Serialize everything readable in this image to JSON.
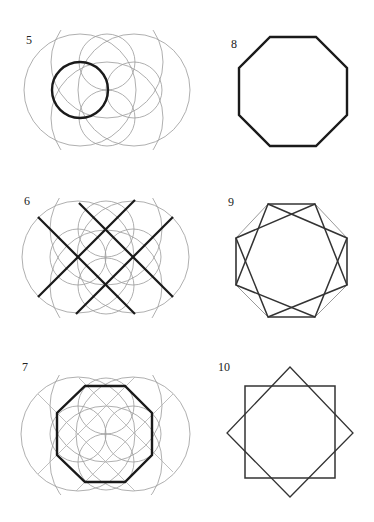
{
  "colors": {
    "background": "#ffffff",
    "construction": "#9a9a9a",
    "construction_light": "#b0b0b0",
    "thick": "#1a1a1a",
    "medium": "#333333",
    "label": "#222222"
  },
  "panels": [
    {
      "id": "5",
      "label": "5",
      "label_pos": [
        26,
        34
      ],
      "description": "Overlapping construction circles with one thick circle",
      "thin_circles": [
        {
          "cx": 80,
          "cy": 90,
          "r": 56
        },
        {
          "cx": 134,
          "cy": 90,
          "r": 56
        },
        {
          "cx": 80,
          "cy": 90,
          "r": 28
        },
        {
          "cx": 134,
          "cy": 90,
          "r": 28
        },
        {
          "cx": 107,
          "cy": 62,
          "r": 28
        },
        {
          "cx": 107,
          "cy": 118,
          "r": 28
        },
        {
          "cx": 107,
          "cy": 62,
          "r": 56,
          "clip": true
        },
        {
          "cx": 107,
          "cy": 118,
          "r": 56,
          "clip": true
        }
      ],
      "thick_circles": [
        {
          "cx": 80,
          "cy": 90,
          "r": 28
        }
      ]
    },
    {
      "id": "8",
      "label": "8",
      "label_pos": [
        231,
        38
      ],
      "description": "Regular octagon",
      "thick_polygons": [
        [
          [
            270,
            37
          ],
          [
            316,
            37
          ],
          [
            347,
            68
          ],
          [
            347,
            115
          ],
          [
            316,
            146
          ],
          [
            270,
            146
          ],
          [
            239,
            115
          ],
          [
            239,
            68
          ]
        ]
      ]
    },
    {
      "id": "6",
      "label": "6",
      "label_pos": [
        24,
        195
      ],
      "description": "Construction circles with four thick diagonal lines",
      "thin_circles": [
        {
          "cx": 78,
          "cy": 257,
          "r": 56
        },
        {
          "cx": 133,
          "cy": 257,
          "r": 56
        },
        {
          "cx": 78,
          "cy": 257,
          "r": 28
        },
        {
          "cx": 133,
          "cy": 257,
          "r": 28
        },
        {
          "cx": 106,
          "cy": 229,
          "r": 28
        },
        {
          "cx": 106,
          "cy": 286,
          "r": 28
        },
        {
          "cx": 106,
          "cy": 229,
          "r": 56,
          "clip": true
        },
        {
          "cx": 106,
          "cy": 286,
          "r": 56,
          "clip": true
        }
      ],
      "thick_lines": [
        [
          38,
          217,
          135,
          314
        ],
        [
          79,
          203,
          173,
          297
        ],
        [
          38,
          297,
          135,
          200
        ],
        [
          76,
          314,
          173,
          217
        ]
      ]
    },
    {
      "id": "9",
      "label": "9",
      "label_pos": [
        228,
        196
      ],
      "description": "Octagon with two inscribed overlapping squares",
      "octagon": [
        [
          268,
          204
        ],
        [
          315,
          204
        ],
        [
          347,
          238
        ],
        [
          347,
          285
        ],
        [
          315,
          317
        ],
        [
          268,
          317
        ],
        [
          236,
          285
        ],
        [
          236,
          238
        ]
      ],
      "squares": [
        [
          [
            268,
            204
          ],
          [
            347,
            238
          ],
          [
            315,
            317
          ],
          [
            236,
            285
          ]
        ],
        [
          [
            315,
            204
          ],
          [
            347,
            285
          ],
          [
            268,
            317
          ],
          [
            236,
            238
          ]
        ]
      ]
    },
    {
      "id": "7",
      "label": "7",
      "label_pos": [
        22,
        361
      ],
      "description": "Construction circles and lines with thick octagon",
      "thin_circles": [
        {
          "cx": 78,
          "cy": 434,
          "r": 57
        },
        {
          "cx": 133,
          "cy": 434,
          "r": 57
        },
        {
          "cx": 78,
          "cy": 434,
          "r": 28
        },
        {
          "cx": 133,
          "cy": 434,
          "r": 28
        },
        {
          "cx": 106,
          "cy": 406,
          "r": 28
        },
        {
          "cx": 106,
          "cy": 462,
          "r": 28
        },
        {
          "cx": 106,
          "cy": 406,
          "r": 56,
          "clip": true
        },
        {
          "cx": 106,
          "cy": 462,
          "r": 56,
          "clip": true
        }
      ],
      "thin_lines": [
        [
          38,
          394,
          135,
          491
        ],
        [
          79,
          378,
          173,
          472
        ],
        [
          38,
          474,
          135,
          377
        ],
        [
          76,
          491,
          173,
          394
        ]
      ],
      "thick_polygons": [
        [
          [
            85,
            386
          ],
          [
            125,
            386
          ],
          [
            152,
            413
          ],
          [
            152,
            455
          ],
          [
            125,
            482
          ],
          [
            85,
            482
          ],
          [
            57,
            455
          ],
          [
            57,
            413
          ]
        ]
      ]
    },
    {
      "id": "10",
      "label": "10",
      "label_pos": [
        218,
        361
      ],
      "description": "Two overlapping squares forming an eight-pointed star",
      "square": [
        [
          245,
          386
        ],
        [
          335,
          386
        ],
        [
          335,
          478
        ],
        [
          245,
          478
        ]
      ],
      "diamond": [
        [
          290,
          367
        ],
        [
          353,
          433
        ],
        [
          290,
          497
        ],
        [
          227,
          433
        ]
      ]
    }
  ]
}
